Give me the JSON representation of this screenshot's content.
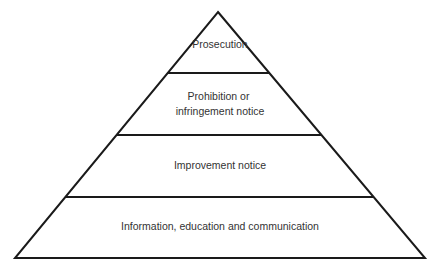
{
  "diagram": {
    "type": "pyramid",
    "tiers": [
      {
        "level": 1,
        "label_lines": [
          "Prosecution"
        ]
      },
      {
        "level": 2,
        "label_lines": [
          "Prohibition or",
          "infringement notice"
        ]
      },
      {
        "level": 3,
        "label_lines": [
          "Improvement notice"
        ]
      },
      {
        "level": 4,
        "label_lines": [
          "Information, education and communication"
        ]
      }
    ],
    "colors": {
      "stroke": "#1a1a1a",
      "fill": "#ffffff",
      "text": "#333333"
    }
  }
}
